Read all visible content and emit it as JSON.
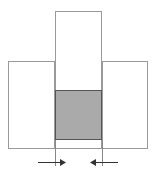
{
  "figure": {
    "title": "",
    "caption": "",
    "background_color": "#ffffff"
  },
  "colors": {
    "outline": "#9a9a9a",
    "outline_dark": "#6e6e6e",
    "shaded_fill": "#aaaaaa",
    "shaded_stroke": "#555555",
    "arrow": "#333333",
    "dimension_line": "#555555",
    "white_fill": "#ffffff"
  },
  "geometry": {
    "left_block": {
      "x": 8,
      "y": 61,
      "width": 47,
      "height": 88
    },
    "right_block": {
      "x": 102,
      "y": 61,
      "width": 46,
      "height": 88
    },
    "center_column": {
      "x": 55,
      "y": 11,
      "width": 47,
      "height": 138
    },
    "shaded_block": {
      "x": 55,
      "y": 90,
      "width": 47,
      "height": 50
    },
    "extension_line_left": {
      "x": 55,
      "y1": 140,
      "y2": 166
    },
    "extension_line_right": {
      "x": 102,
      "y1": 140,
      "y2": 166
    },
    "arrow_left": {
      "x1": 38,
      "y": 162,
      "x2": 64,
      "direction": "right"
    },
    "arrow_right": {
      "x1": 118,
      "y": 162,
      "x2": 92,
      "direction": "left"
    }
  },
  "labels": {
    "left_block": "",
    "right_block": "",
    "center_column": "",
    "shaded_block": "",
    "dimension": ""
  },
  "annotations": {
    "arrow_left_name": "arrow-pointing-right",
    "arrow_right_name": "arrow-pointing-left"
  }
}
